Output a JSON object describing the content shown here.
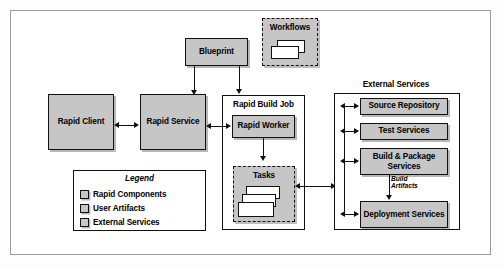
{
  "figure": {
    "kind": "architecture-diagram",
    "colors": {
      "node_fill": "#c6c6c6",
      "container_fill": "#ffffff",
      "stroke": "#111111",
      "frame": "#9a9a9a",
      "sheet_fill": "#ffffff"
    }
  },
  "nodes": {
    "blueprint": "Blueprint",
    "workflows": "Workflows",
    "rapid_client": "Rapid Client",
    "rapid_service": "Rapid Service",
    "rapid_build_job": "Rapid Build Job",
    "rapid_worker": "Rapid Worker",
    "tasks": "Tasks",
    "external_services": "External Services",
    "source_repository": "Source Repository",
    "test_services": "Test Services",
    "build_package_services": "Build & Package Services",
    "deployment_services": "Deployment Services"
  },
  "edge_labels": {
    "build_artifacts": "Build Artifacts"
  },
  "legend": {
    "title": "Legend",
    "items": [
      {
        "label": "Rapid Components"
      },
      {
        "label": "User Artifacts"
      },
      {
        "label": "External Services"
      }
    ]
  }
}
